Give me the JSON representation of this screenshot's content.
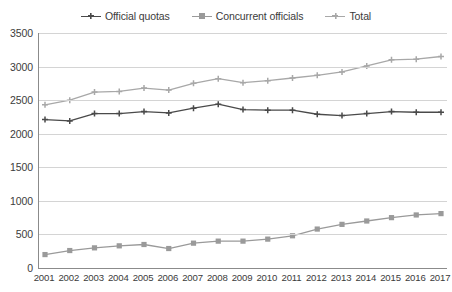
{
  "chart_data": {
    "type": "line",
    "title": "",
    "subtitle": "",
    "xlabel": "",
    "ylabel": "",
    "ylim": [
      0,
      3500
    ],
    "ytick_step": 500,
    "yticks": [
      "0",
      "500",
      "1000",
      "1500",
      "2000",
      "2500",
      "3000",
      "3500"
    ],
    "grid": true,
    "legend_position": "top-center",
    "categories": [
      "2001",
      "2002",
      "2003",
      "2004",
      "2005",
      "2006",
      "2007",
      "2008",
      "2009",
      "2010",
      "2011",
      "2012",
      "2013",
      "2014",
      "2015",
      "2016",
      "2017"
    ],
    "series": [
      {
        "name": "Official quotas",
        "color": "#4a4a4a",
        "marker": "plus",
        "values": [
          2210,
          2190,
          2300,
          2300,
          2330,
          2310,
          2380,
          2440,
          2360,
          2350,
          2350,
          2290,
          2270,
          2300,
          2330,
          2320,
          2320
        ]
      },
      {
        "name": "Concurrent officials",
        "color": "#9a9a9a",
        "marker": "square",
        "values": [
          200,
          260,
          300,
          330,
          350,
          290,
          370,
          400,
          400,
          430,
          480,
          580,
          650,
          700,
          750,
          790,
          810
        ]
      },
      {
        "name": "Total",
        "color": "#a8a8a8",
        "marker": "plus",
        "values": [
          2430,
          2500,
          2620,
          2630,
          2680,
          2650,
          2750,
          2820,
          2760,
          2790,
          2830,
          2870,
          2920,
          3010,
          3100,
          3110,
          3150
        ]
      }
    ]
  },
  "legend": {
    "items": [
      {
        "label": "Official quotas",
        "color": "#4a4a4a",
        "marker": "plus"
      },
      {
        "label": "Concurrent officials",
        "color": "#9a9a9a",
        "marker": "square"
      },
      {
        "label": "Total",
        "color": "#a8a8a8",
        "marker": "plus"
      }
    ]
  },
  "axis": {
    "y_max": 3500,
    "y_min": 0,
    "axis_color": "#8b8b8b",
    "grid_color": "#d4d4d4"
  }
}
